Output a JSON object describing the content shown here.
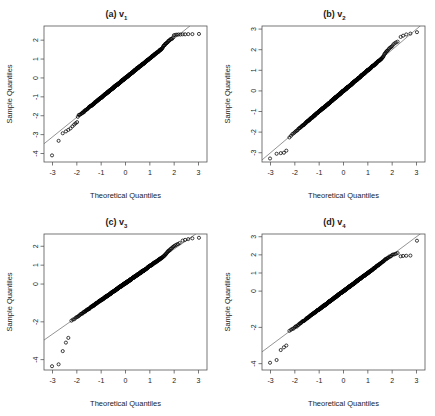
{
  "figure": {
    "background": "#ffffff",
    "width": 435,
    "height": 416
  },
  "chart_data": [
    {
      "type": "scatter",
      "panel": "a",
      "title": "(a) v",
      "title_sub": "1",
      "xlabel": "Theoretical Quantiles",
      "ylabel": "Sample Quantiles",
      "xticks": [
        -3,
        -2,
        -1,
        0,
        1,
        2,
        3
      ],
      "xticklabels": [
        "-3",
        "-2",
        "-1",
        "0",
        "1",
        "2",
        "3"
      ],
      "yticks": [
        2,
        1,
        0,
        -1,
        -2,
        -3,
        -4
      ],
      "yticklabels": [
        "2",
        "1",
        "0",
        "-1",
        "-2",
        "-3",
        "-4"
      ],
      "xlim": [
        -3.35,
        3.35
      ],
      "ylim": [
        -4.45,
        2.75
      ],
      "grid": false,
      "legend": false,
      "reference_line": {
        "slope": 1.04,
        "intercept": 0.0,
        "color": "#666666"
      },
      "series": [
        {
          "name": "sample quantiles",
          "marker": "open-circle",
          "n": 400,
          "x": [
            -3.02,
            -2.75,
            -2.58,
            -2.45,
            -2.35,
            -2.26,
            -2.18,
            -2.11,
            -2.05,
            -1.99,
            -1.93,
            -1.88,
            -1.83,
            -1.79,
            -1.74,
            -1.7,
            -1.66,
            -1.63,
            -1.59,
            -1.56,
            -1.52,
            -1.49,
            -1.46,
            -1.43,
            -1.4,
            -1.38,
            -1.35,
            -1.32,
            -1.3,
            -1.27,
            -1.25,
            -1.22,
            -1.2,
            -1.18,
            -1.15,
            -1.13,
            -1.11,
            -1.09,
            -1.07,
            -1.05,
            -1.03,
            -1.01,
            -0.99,
            -0.97,
            -0.95,
            -0.93,
            -0.91,
            -0.9,
            -0.88,
            -0.86,
            -0.84,
            -0.83,
            -0.81,
            -0.79,
            -0.78,
            -0.76,
            -0.74,
            -0.73,
            -0.71,
            -0.7,
            -0.68,
            -0.67,
            -0.65,
            -0.64,
            -0.62,
            -0.61,
            -0.59,
            -0.58,
            -0.56,
            -0.55,
            -0.53,
            -0.52,
            -0.51,
            -0.49,
            -0.48,
            -0.47,
            -0.45,
            -0.44,
            -0.43,
            -0.41,
            -0.4,
            -0.39,
            -0.37,
            -0.36,
            -0.35,
            -0.33,
            -0.32,
            -0.31,
            -0.3,
            -0.28,
            -0.27,
            -0.26,
            -0.25,
            -0.23,
            -0.22,
            -0.21,
            -0.2,
            -0.18,
            -0.17,
            -0.16,
            -0.15,
            -0.14,
            -0.12,
            -0.11,
            -0.1,
            -0.09,
            -0.08,
            -0.06,
            -0.05,
            -0.04,
            -0.03,
            -0.02,
            -0.01,
            0.01,
            0.02,
            0.03,
            0.04,
            0.05,
            0.06,
            0.08,
            0.09,
            0.1,
            0.11,
            0.12,
            0.14,
            0.15,
            0.16,
            0.17,
            0.18,
            0.2,
            0.21,
            0.22,
            0.23,
            0.25,
            0.26,
            0.27,
            0.28,
            0.3,
            0.31,
            0.32,
            0.33,
            0.35,
            0.36,
            0.37,
            0.39,
            0.4,
            0.41,
            0.43,
            0.44,
            0.45,
            0.47,
            0.48,
            0.49,
            0.51,
            0.52,
            0.53,
            0.55,
            0.56,
            0.58,
            0.59,
            0.61,
            0.62,
            0.64,
            0.65,
            0.67,
            0.68,
            0.7,
            0.71,
            0.73,
            0.74,
            0.76,
            0.78,
            0.79,
            0.81,
            0.83,
            0.84,
            0.86,
            0.88,
            0.9,
            0.91,
            0.93,
            0.95,
            0.97,
            0.99,
            1.01,
            1.03,
            1.05,
            1.07,
            1.09,
            1.11,
            1.13,
            1.15,
            1.18,
            1.2,
            1.22,
            1.25,
            1.27,
            1.3,
            1.32,
            1.35,
            1.38,
            1.4,
            1.43,
            1.46,
            1.49,
            1.52,
            1.56,
            1.59,
            1.63,
            1.66,
            1.7,
            1.74,
            1.79,
            1.83,
            1.88,
            1.93,
            1.99,
            2.05,
            2.11,
            2.18,
            2.26,
            2.35,
            2.45,
            2.58,
            2.75,
            3.02
          ],
          "y": [
            -4.1,
            -3.33,
            -2.93,
            -2.83,
            -2.75,
            -2.67,
            -2.56,
            -2.47,
            -2.4,
            -2.34,
            -2.2,
            -2.16,
            -2.12,
            -2.05,
            -1.96,
            -1.88,
            -1.8,
            -1.76,
            -1.72,
            -1.66,
            -1.6,
            -1.56,
            -1.52,
            -1.48,
            -1.45,
            -1.42,
            -1.4,
            -1.37,
            -1.34,
            -1.31,
            -1.29,
            -1.26,
            -1.24,
            -1.21,
            -1.19,
            -1.17,
            -1.15,
            -1.13,
            -1.11,
            -1.09,
            -1.07,
            -1.05,
            -1.03,
            -1.01,
            -0.99,
            -0.97,
            -0.95,
            -0.93,
            -0.91,
            -0.89,
            -0.87,
            -0.86,
            -0.84,
            -0.82,
            -0.81,
            -0.79,
            -0.77,
            -0.76,
            -0.74,
            -0.72,
            -0.71,
            -0.69,
            -0.68,
            -0.66,
            -0.65,
            -0.63,
            -0.62,
            -0.6,
            -0.59,
            -0.57,
            -0.56,
            -0.54,
            -0.53,
            -0.51,
            -0.5,
            -0.49,
            -0.47,
            -0.46,
            -0.44,
            -0.43,
            -0.42,
            -0.4,
            -0.39,
            -0.38,
            -0.36,
            -0.35,
            -0.34,
            -0.32,
            -0.31,
            -0.3,
            -0.28,
            -0.27,
            -0.26,
            -0.24,
            -0.23,
            -0.22,
            -0.21,
            -0.19,
            -0.18,
            -0.17,
            -0.16,
            -0.14,
            -0.13,
            -0.12,
            -0.11,
            -0.09,
            -0.08,
            -0.07,
            -0.06,
            -0.04,
            -0.03,
            -0.02,
            -0.01,
            0.01,
            0.02,
            0.03,
            0.05,
            0.06,
            0.07,
            0.08,
            0.1,
            0.11,
            0.12,
            0.13,
            0.15,
            0.16,
            0.17,
            0.18,
            0.2,
            0.21,
            0.22,
            0.24,
            0.25,
            0.26,
            0.27,
            0.29,
            0.3,
            0.31,
            0.33,
            0.34,
            0.35,
            0.37,
            0.38,
            0.4,
            0.41,
            0.42,
            0.44,
            0.45,
            0.47,
            0.48,
            0.5,
            0.51,
            0.53,
            0.54,
            0.56,
            0.57,
            0.59,
            0.6,
            0.62,
            0.64,
            0.65,
            0.67,
            0.69,
            0.7,
            0.72,
            0.74,
            0.76,
            0.78,
            0.79,
            0.81,
            0.83,
            0.85,
            0.87,
            0.89,
            0.92,
            0.94,
            0.96,
            0.98,
            1.01,
            1.03,
            1.05,
            1.08,
            1.1,
            1.13,
            1.16,
            1.19,
            1.21,
            1.24,
            1.27,
            1.3,
            1.33,
            1.37,
            1.4,
            1.44,
            1.47,
            1.51,
            1.55,
            1.59,
            1.63,
            1.68,
            1.72,
            1.77,
            1.82,
            1.88,
            1.93,
            1.99,
            2.05,
            2.09,
            2.12,
            2.15,
            2.17,
            2.19,
            2.2,
            2.22,
            2.23,
            2.25,
            2.26,
            2.28,
            2.29,
            2.3,
            2.3,
            2.31,
            2.31,
            2.32,
            2.32,
            2.33
          ]
        }
      ]
    },
    {
      "type": "scatter",
      "panel": "b",
      "title": "(b) v",
      "title_sub": "2",
      "xlabel": "Theoretical Quantiles",
      "ylabel": "Sample Quantiles",
      "xticks": [
        -3,
        -2,
        -1,
        0,
        1,
        2,
        3
      ],
      "xticklabels": [
        "-3",
        "-2",
        "-1",
        "0",
        "1",
        "2",
        "3"
      ],
      "yticks": [
        3,
        2,
        1,
        0,
        -1,
        -2,
        -3
      ],
      "yticklabels": [
        "3",
        "2",
        "1",
        "0",
        "-1",
        "-2",
        "-3"
      ],
      "xlim": [
        -3.35,
        3.35
      ],
      "ylim": [
        -3.45,
        3.15
      ],
      "grid": false,
      "legend": false,
      "reference_line": {
        "slope": 1.0,
        "intercept": 0.0,
        "color": "#666666"
      },
      "series": [
        {
          "name": "sample quantiles",
          "marker": "open-circle",
          "n": 400,
          "tail_low": {
            "x": [
              -3.02,
              -2.75,
              -2.58,
              -2.45,
              -2.35
            ],
            "y": [
              -3.28,
              -3.05,
              -3.02,
              -3.0,
              -2.9
            ]
          },
          "tail_high": {
            "x": [
              2.35,
              2.45,
              2.58,
              2.75,
              3.02
            ],
            "y": [
              2.62,
              2.68,
              2.74,
              2.78,
              2.85
            ]
          }
        }
      ]
    },
    {
      "type": "scatter",
      "panel": "c",
      "title": "(c) v",
      "title_sub": "3",
      "xlabel": "Theoretical Quantiles",
      "ylabel": "Sample Quantiles",
      "xticks": [
        -3,
        -2,
        -1,
        0,
        1,
        2,
        3
      ],
      "xticklabels": [
        "-3",
        "-2",
        "-1",
        "0",
        "1",
        "2",
        "3"
      ],
      "yticks": [
        2,
        1,
        0,
        -2,
        -4
      ],
      "yticklabels": [
        "2",
        "1",
        "0",
        "-2",
        "-4"
      ],
      "xlim": [
        -3.35,
        3.35
      ],
      "ylim": [
        -4.55,
        2.65
      ],
      "grid": false,
      "legend": false,
      "reference_line": {
        "slope": 0.9,
        "intercept": 0.05,
        "color": "#666666"
      },
      "series": [
        {
          "name": "sample quantiles",
          "marker": "open-circle",
          "n": 400,
          "tail_low": {
            "x": [
              -3.02,
              -2.75,
              -2.58,
              -2.45,
              -2.35
            ],
            "y": [
              -4.35,
              -4.25,
              -3.55,
              -3.1,
              -2.85
            ]
          },
          "tail_high": {
            "x": [
              2.35,
              2.45,
              2.58,
              2.75,
              3.02
            ],
            "y": [
              2.3,
              2.34,
              2.38,
              2.42,
              2.45
            ]
          }
        }
      ]
    },
    {
      "type": "scatter",
      "panel": "d",
      "title": "(d) v",
      "title_sub": "4",
      "xlabel": "Theoretical Quantiles",
      "ylabel": "Sample Quantiles",
      "xticks": [
        -3,
        -2,
        -1,
        0,
        1,
        2,
        3
      ],
      "xticklabels": [
        "-3",
        "-2",
        "-1",
        "0",
        "1",
        "2",
        "3"
      ],
      "yticks": [
        3,
        2,
        1,
        0,
        -2,
        -4
      ],
      "yticklabels": [
        "3",
        "2",
        "1",
        "0",
        "-2",
        "-4"
      ],
      "xlim": [
        -3.35,
        3.35
      ],
      "ylim": [
        -4.35,
        3.15
      ],
      "grid": false,
      "legend": false,
      "reference_line": {
        "slope": 1.0,
        "intercept": 0.0,
        "color": "#666666"
      },
      "series": [
        {
          "name": "sample quantiles",
          "marker": "open-circle",
          "n": 400,
          "tail_low": {
            "x": [
              -3.02,
              -2.75,
              -2.58,
              -2.45,
              -2.35
            ],
            "y": [
              -3.95,
              -3.8,
              -3.25,
              -3.1,
              -3.0
            ]
          },
          "tail_high": {
            "x": [
              2.35,
              2.45,
              2.58,
              2.75,
              3.02
            ],
            "y": [
              1.92,
              1.94,
              1.95,
              1.96,
              2.78
            ]
          }
        }
      ]
    }
  ]
}
